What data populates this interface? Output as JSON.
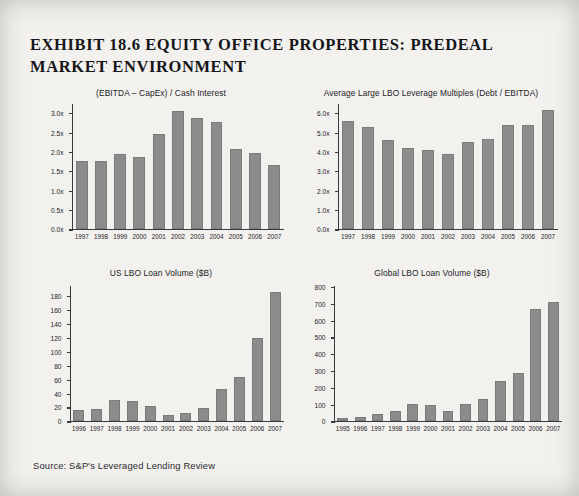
{
  "exhibit": {
    "title": "EXHIBIT 18.6 EQUITY OFFICE PROPERTIES: PREDEAL MARKET ENVIRONMENT",
    "source": "Source: S&P's Leveraged Lending Review",
    "bar_color": "#8c8c8c",
    "page_background": "#f2f1ee",
    "text_color": "#232327"
  },
  "chart_data": [
    {
      "id": "ebitda-capex-cash-interest",
      "type": "bar",
      "title": "(EBITDA – CapEx) / Cash Interest",
      "xlabel": "",
      "ylabel": "",
      "ylim": [
        0.0,
        3.25
      ],
      "ytick_values": [
        0.0,
        0.5,
        1.0,
        1.5,
        2.0,
        2.5,
        3.0
      ],
      "ytick_labels": [
        "0.0x",
        "0.5x",
        "1.0x",
        "1.5x",
        "2.0x",
        "2.5x",
        "3.0x"
      ],
      "grid": false,
      "legend": "none",
      "categories": [
        "1997",
        "1998",
        "1999",
        "2000",
        "2001",
        "2002",
        "2003",
        "2004",
        "2005",
        "2006",
        "2007"
      ],
      "values": [
        1.76,
        1.76,
        1.95,
        1.87,
        2.46,
        3.06,
        2.88,
        2.78,
        2.08,
        1.97,
        1.67
      ]
    },
    {
      "id": "avg-large-lbo-leverage-multiples",
      "type": "bar",
      "title": "Average Large LBO Leverage Multiples (Debt / EBITDA)",
      "xlabel": "",
      "ylabel": "",
      "ylim": [
        0.0,
        6.5
      ],
      "ytick_values": [
        0.0,
        1.0,
        2.0,
        3.0,
        4.0,
        5.0,
        6.0
      ],
      "ytick_labels": [
        "0.0x",
        "1.0x",
        "2.0x",
        "3.0x",
        "4.0x",
        "5.0x",
        "6.0x"
      ],
      "grid": false,
      "legend": "none",
      "categories": [
        "1997",
        "1998",
        "1999",
        "2000",
        "2001",
        "2002",
        "2003",
        "2004",
        "2005",
        "2006",
        "2007"
      ],
      "values": [
        5.6,
        5.3,
        4.6,
        4.2,
        4.1,
        3.9,
        4.5,
        4.7,
        5.4,
        5.4,
        6.2
      ]
    },
    {
      "id": "us-lbo-loan-volume",
      "type": "bar",
      "title": "US LBO Loan Volume ($B)",
      "xlabel": "",
      "ylabel": "",
      "ylim": [
        0,
        195
      ],
      "ytick_values": [
        0,
        20,
        40,
        60,
        80,
        100,
        120,
        140,
        160,
        180
      ],
      "ytick_labels": [
        "0",
        "20",
        "40",
        "60",
        "80",
        "100",
        "120",
        "140",
        "160",
        "180"
      ],
      "grid": false,
      "legend": "none",
      "categories": [
        "1996",
        "1997",
        "1998",
        "1999",
        "2000",
        "2001",
        "2002",
        "2003",
        "2004",
        "2005",
        "2006",
        "2007"
      ],
      "values": [
        16,
        17,
        30,
        29,
        21,
        8,
        11,
        19,
        46,
        63,
        120,
        187
      ]
    },
    {
      "id": "global-lbo-loan-volume",
      "type": "bar",
      "title": "Global LBO Loan Volume ($B)",
      "xlabel": "",
      "ylabel": "",
      "ylim": [
        0,
        810
      ],
      "ytick_values": [
        0,
        100,
        200,
        300,
        400,
        500,
        600,
        700,
        800
      ],
      "ytick_labels": [
        "0",
        "100",
        "200",
        "300",
        "400",
        "500",
        "600",
        "700",
        "800"
      ],
      "grid": false,
      "legend": "none",
      "categories": [
        "1995",
        "1996",
        "1997",
        "1998",
        "1999",
        "2000",
        "2001",
        "2002",
        "2003",
        "2004",
        "2005",
        "2006",
        "2007"
      ],
      "values": [
        18,
        22,
        37,
        55,
        103,
        95,
        57,
        99,
        133,
        240,
        285,
        670,
        715
      ]
    }
  ]
}
